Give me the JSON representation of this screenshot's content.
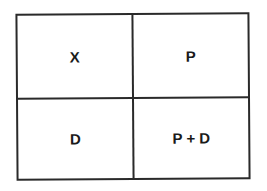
{
  "diagram": {
    "type": "2x2 grid",
    "line_color": "#2a2a2a",
    "cells": [
      {
        "row": 0,
        "col": 0,
        "label": "X"
      },
      {
        "row": 0,
        "col": 1,
        "label": "P"
      },
      {
        "row": 1,
        "col": 0,
        "label": "D"
      },
      {
        "row": 1,
        "col": 1,
        "label": "P + D"
      }
    ]
  }
}
